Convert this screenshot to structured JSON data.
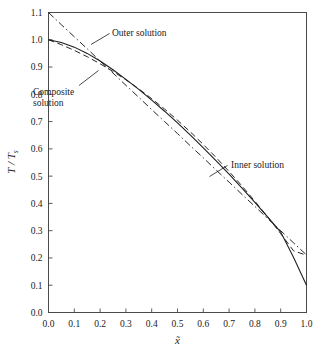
{
  "chart_data": {
    "type": "line",
    "title": "",
    "xlabel": "x̃",
    "ylabel": "T / Tₛ",
    "ylabel_main": "T / T",
    "ylabel_sub": "s",
    "xlim": [
      0.0,
      1.0
    ],
    "ylim": [
      0.0,
      1.1
    ],
    "grid": false,
    "legend_position": "inline-annotations",
    "xticks": [
      "0.0",
      "0.1",
      "0.2",
      "0.3",
      "0.4",
      "0.5",
      "0.6",
      "0.7",
      "0.8",
      "0.9",
      "1.0"
    ],
    "xtick_values": [
      0.0,
      0.1,
      0.2,
      0.3,
      0.4,
      0.5,
      0.6,
      0.7,
      0.8,
      0.9,
      1.0
    ],
    "yticks": [
      "0.0",
      "0.1",
      "0.2",
      "0.3",
      "0.4",
      "0.5",
      "0.6",
      "0.7",
      "0.8",
      "0.9",
      "1.0",
      "1.1"
    ],
    "ytick_values": [
      0.0,
      0.1,
      0.2,
      0.3,
      0.4,
      0.5,
      0.6,
      0.7,
      0.8,
      0.9,
      1.0,
      1.1
    ],
    "x": [
      0.0,
      0.05,
      0.1,
      0.15,
      0.2,
      0.25,
      0.3,
      0.35,
      0.4,
      0.45,
      0.5,
      0.55,
      0.6,
      0.65,
      0.7,
      0.75,
      0.8,
      0.85,
      0.9,
      0.95,
      1.0
    ],
    "series": [
      {
        "name": "Outer solution",
        "style": "dash-dot",
        "values": [
          1.1,
          1.055,
          1.011,
          0.967,
          0.922,
          0.878,
          0.833,
          0.789,
          0.744,
          0.7,
          0.656,
          0.611,
          0.567,
          0.522,
          0.478,
          0.433,
          0.389,
          0.344,
          0.3,
          0.255,
          0.211
        ]
      },
      {
        "name": "Inner solution",
        "style": "dashed",
        "values": [
          1.0,
          0.982,
          0.961,
          0.938,
          0.912,
          0.884,
          0.853,
          0.82,
          0.784,
          0.746,
          0.705,
          0.662,
          0.616,
          0.568,
          0.517,
          0.464,
          0.408,
          0.35,
          0.289,
          0.226,
          0.21
        ]
      },
      {
        "name": "Composite solution",
        "style": "solid",
        "values": [
          1.0,
          0.99,
          0.973,
          0.95,
          0.922,
          0.89,
          0.855,
          0.818,
          0.779,
          0.738,
          0.695,
          0.65,
          0.604,
          0.556,
          0.507,
          0.456,
          0.404,
          0.35,
          0.295,
          0.202,
          0.1
        ]
      }
    ],
    "annotations": [
      {
        "text": "Outer solution",
        "target_x": 0.155,
        "target_y": 1.015
      },
      {
        "text": "Composite",
        "text2": "solution",
        "target_x": 0.225,
        "target_y": 0.905
      },
      {
        "text": "Inner solution",
        "target_x": 0.64,
        "target_y": 0.545
      }
    ]
  }
}
